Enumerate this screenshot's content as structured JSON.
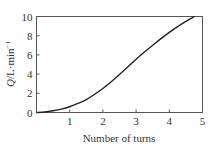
{
  "chart_data": {
    "type": "line",
    "title": "",
    "xlabel": "Number of turns",
    "ylabel": "Q/L·min⁻¹",
    "ylabel_parts": {
      "italic": "Q",
      "rest": "/L·min",
      "sup": "−1"
    },
    "xlim": [
      0,
      5
    ],
    "ylim": [
      0,
      10
    ],
    "xticks": [
      1,
      2,
      3,
      4,
      5
    ],
    "yticks": [
      0,
      2,
      4,
      6,
      8,
      10
    ],
    "grid": false,
    "legend": null,
    "series": [
      {
        "name": "Q",
        "color": "#222222",
        "x": [
          0,
          0.25,
          0.5,
          0.75,
          1.0,
          1.25,
          1.5,
          1.75,
          2.0,
          2.25,
          2.5,
          2.75,
          3.0,
          3.25,
          3.5,
          3.75,
          4.0,
          4.25,
          4.5,
          4.76
        ],
        "values": [
          0,
          0.05,
          0.18,
          0.35,
          0.6,
          0.95,
          1.35,
          1.9,
          2.5,
          3.2,
          3.95,
          4.75,
          5.55,
          6.3,
          7.0,
          7.7,
          8.35,
          8.95,
          9.5,
          10.0
        ]
      }
    ]
  }
}
